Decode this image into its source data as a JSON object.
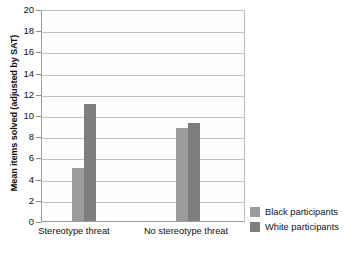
{
  "chart_data": {
    "type": "bar",
    "title": "",
    "subtitle": "",
    "xlabel": "",
    "ylabel": "Mean items solved (adjusted by SAT)",
    "categories": [
      "Stereotype threat",
      "No stereotype threat"
    ],
    "series": [
      {
        "name": "Black participants",
        "color": "#9c9c9c",
        "values": [
          5.0,
          8.8
        ]
      },
      {
        "name": "White participants",
        "color": "#7e7e7e",
        "values": [
          11.0,
          9.2
        ]
      }
    ],
    "ylim": [
      0,
      20
    ],
    "ytick_step": 2,
    "yticks": [
      0,
      2,
      4,
      6,
      8,
      10,
      12,
      14,
      16,
      18,
      20
    ],
    "ytick_labels": [
      "0",
      "2",
      "4",
      "6",
      "8",
      "10",
      "12",
      "14",
      "16",
      "18",
      "20"
    ],
    "grid": {
      "horizontal": true,
      "vertical": false
    },
    "legend": {
      "position": "right-bottom",
      "orientation": "vertical"
    },
    "annotations": []
  },
  "axes": {
    "y_title": "Mean items solved (adjusted by SAT)",
    "tick_0": "0",
    "tick_2": "2",
    "tick_4": "4",
    "tick_6": "6",
    "tick_8": "8",
    "tick_10": "10",
    "tick_12": "12",
    "tick_14": "14",
    "tick_16": "16",
    "tick_18": "18",
    "tick_20": "20"
  },
  "categories": {
    "cat_0": "Stereotype threat",
    "cat_1": "No stereotype threat"
  },
  "legend": {
    "item_0_label": "Black participants",
    "item_1_label": "White participants"
  },
  "colors": {
    "black_participants": "#9c9c9c",
    "white_participants": "#7e7e7e",
    "gridline": "#c2c2c2",
    "axis": "#9b9b9b",
    "background": "#ffffff"
  }
}
